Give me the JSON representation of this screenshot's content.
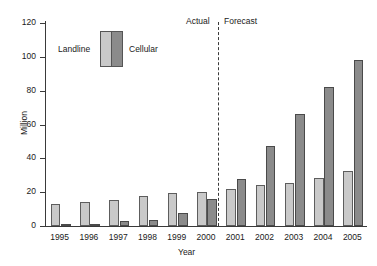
{
  "chart_data": {
    "type": "bar",
    "title": "",
    "xlabel": "Year",
    "ylabel": "Million",
    "ylim": [
      0,
      120
    ],
    "yticks": [
      0,
      20,
      40,
      60,
      80,
      100,
      120
    ],
    "grid": false,
    "legend_position": "top-left",
    "categories": [
      "1995",
      "1996",
      "1997",
      "1998",
      "1999",
      "2000",
      "2001",
      "2002",
      "2003",
      "2004",
      "2005"
    ],
    "series": [
      {
        "name": "Landline",
        "color": "#c9c9c9",
        "values": [
          13.2,
          14.3,
          15.3,
          17.5,
          19.3,
          20.1,
          22.0,
          24.2,
          25.7,
          28.6,
          32.6
        ]
      },
      {
        "name": "Cellular",
        "color": "#8b8b8b",
        "values": [
          0.6,
          1.1,
          2.8,
          3.5,
          7.7,
          16.2,
          28.0,
          47.4,
          66.2,
          82.0,
          98.4
        ]
      }
    ],
    "annotations": [
      {
        "name": "actual-label",
        "text": "Actual",
        "x_position": "left-of-divider"
      },
      {
        "name": "forecast-label",
        "text": "Forecast",
        "x_position": "right-of-divider"
      },
      {
        "name": "era-divider",
        "text": "",
        "style": "dashed-vertical",
        "between": [
          "2000",
          "2001"
        ]
      }
    ]
  },
  "legend": {
    "landline_label": "Landline",
    "cellular_label": "Cellular"
  },
  "axes": {
    "y_title": "Million",
    "x_title": "Year"
  },
  "eras": {
    "actual": "Actual",
    "forecast": "Forecast"
  },
  "colors": {
    "landline": "#c9c9c9",
    "cellular": "#8b8b8b",
    "axis": "#3a3a3a",
    "background": "#ffffff"
  }
}
